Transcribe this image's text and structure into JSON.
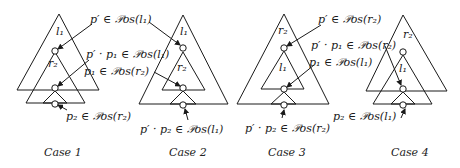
{
  "cases": [
    {
      "caption": "Case 1",
      "outer_label": "l₁",
      "inner_label": "r₂",
      "annotations": [
        "p′ ∈ 𝒫os(l₁)",
        "p′ · p₁ ∈ 𝒫os(l₁)",
        "p₁ ∈ 𝒫os(r₂)",
        "p₂ ∈ 𝒫os(r₂)"
      ]
    },
    {
      "caption": "Case 2",
      "outer_label": "l₁",
      "inner_label": "r₂",
      "annotations": [
        "p′ · p₂ ∈ 𝒫os(l₁)"
      ]
    },
    {
      "caption": "Case 3",
      "outer_label": "r₂",
      "inner_label": "l₁",
      "annotations": [
        "p′ ∈ 𝒫os(r₂)",
        "p′ · p₁ ∈ 𝒫os(r₂)",
        "p₁ ∈ 𝒫os(l₁)",
        "p′ · p₂ ∈ 𝒫os(r₂)"
      ]
    },
    {
      "caption": "Case 4",
      "outer_label": "r₂",
      "inner_label": "l₁",
      "annotations": [
        "p₂ ∈ 𝒫os(l₁)"
      ]
    }
  ]
}
